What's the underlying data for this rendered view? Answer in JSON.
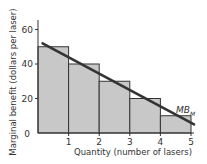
{
  "chart_data": {
    "type": "bar",
    "title": "",
    "xlabel": "Quantity (number of lasers)",
    "ylabel": "Marginal benefit (dollars per laser)",
    "categories": [
      "1",
      "2",
      "3",
      "4",
      "5"
    ],
    "values": [
      50,
      40,
      30,
      20,
      10
    ],
    "xlim": [
      0,
      5
    ],
    "ylim": [
      0,
      70
    ],
    "x_ticks": [
      "1",
      "2",
      "3",
      "4",
      "5"
    ],
    "y_ticks": [
      "0",
      "20",
      "40",
      "60"
    ],
    "grid": false,
    "bar_color": "#c8c8c8",
    "bar_edge_color": "#333333",
    "overlay_line": {
      "label": "MB",
      "label_subscript": "M",
      "points": [
        [
          0.15,
          52
        ],
        [
          5.1,
          5
        ]
      ],
      "color": "#333333"
    }
  },
  "axes": {
    "origin_label": "0",
    "xlabel": "Quantity (number of lasers)",
    "ylabel": "Marginal benefit (dollars per laser)"
  },
  "curve_label": {
    "main": "MB",
    "sub": "M"
  }
}
